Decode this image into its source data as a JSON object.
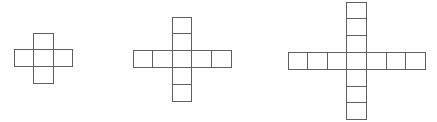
{
  "page": {
    "background_color": "#ffffff",
    "width": 437,
    "height": 122
  },
  "style": {
    "stroke_color": "#5f5f5f",
    "fill_color": "#ffffff",
    "stroke_width": 1,
    "cell_width": 19.6,
    "cell_height": 16.8
  },
  "chart_data": {
    "type": "diagram",
    "figures": [
      {
        "name": "figure-1",
        "label": "Figure 1",
        "arm_length": 1,
        "square_count": 5,
        "horizontal_cells": 3,
        "vertical_cells": 3,
        "origin_x": 14,
        "origin_y": 33,
        "center_col": 1,
        "center_row": 1
      },
      {
        "name": "figure-2",
        "label": "Figure 2",
        "arm_length": 2,
        "square_count": 9,
        "horizontal_cells": 5,
        "vertical_cells": 5,
        "origin_x": 133,
        "origin_y": 17,
        "center_col": 2,
        "center_row": 2
      },
      {
        "name": "figure-3",
        "label": "Figure 3",
        "arm_length": 3,
        "square_count": 13,
        "horizontal_cells": 7,
        "vertical_cells": 7,
        "origin_x": 288,
        "origin_y": 2,
        "center_col": 3,
        "center_row": 3
      }
    ]
  }
}
